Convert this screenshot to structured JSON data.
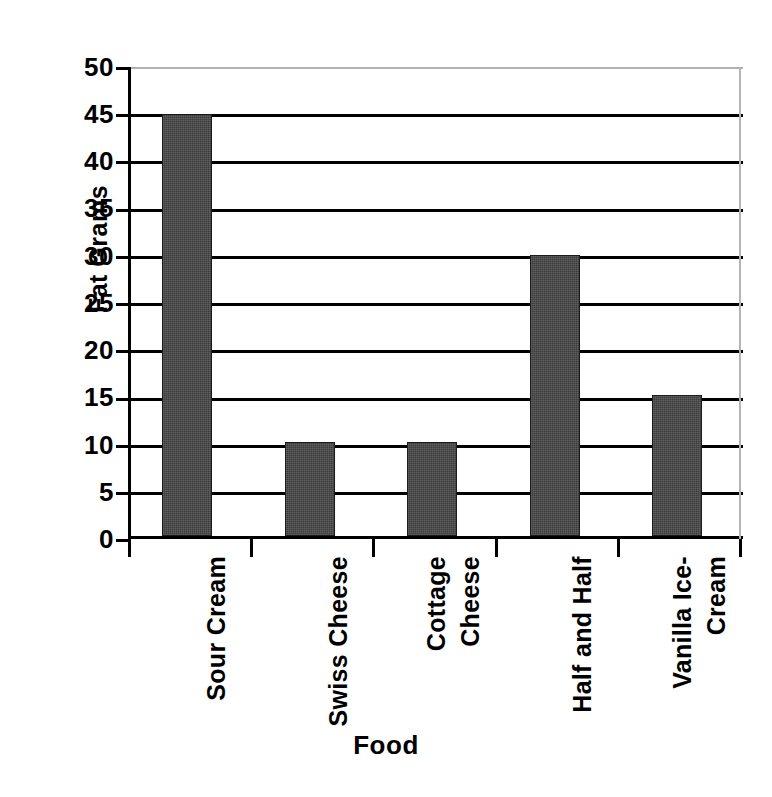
{
  "chart_data": {
    "type": "bar",
    "title": "",
    "categories": [
      "Sour Cream",
      "Swiss Cheese",
      "Cottage Cheese",
      "Half and Half",
      "Vanilla Ice-Cream"
    ],
    "category_lines": [
      [
        "Sour Cream"
      ],
      [
        "Swiss Cheese"
      ],
      [
        "Cottage",
        "Cheese"
      ],
      [
        "Half and Half"
      ],
      [
        "Vanilla Ice-",
        "Cream"
      ]
    ],
    "values": [
      45,
      10,
      10,
      30,
      15
    ],
    "xlabel": "Food",
    "ylabel": "Fat Grams",
    "ylim": [
      0,
      50
    ],
    "ytick_step": 5,
    "yticks": [
      50,
      45,
      40,
      35,
      30,
      25,
      20,
      15,
      10,
      5,
      0
    ],
    "ytick_labels": [
      "50",
      "45",
      "40",
      "35",
      "30",
      "25",
      "20",
      "15",
      "10",
      "5",
      "0"
    ],
    "grid": "horizontal",
    "legend": "none",
    "bar_color": "#3b3b3b",
    "axis_color": "#000000",
    "gridline_color": "#000000",
    "top_border_color": "#b0b0b0",
    "background_color": "#ffffff"
  }
}
